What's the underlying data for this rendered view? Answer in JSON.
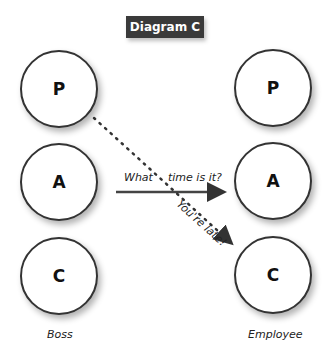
{
  "title": "Diagram C",
  "boss": {
    "label": "Boss",
    "states": [
      "P",
      "A",
      "C"
    ]
  },
  "employee": {
    "label": "Employee",
    "states": [
      "P",
      "A",
      "C"
    ]
  },
  "messages": [
    {
      "text": "What time is it?",
      "from": "A",
      "to": "A",
      "style": "solid"
    },
    {
      "text": "You're late!",
      "from": "P",
      "to": "C",
      "style": "dotted"
    }
  ]
}
